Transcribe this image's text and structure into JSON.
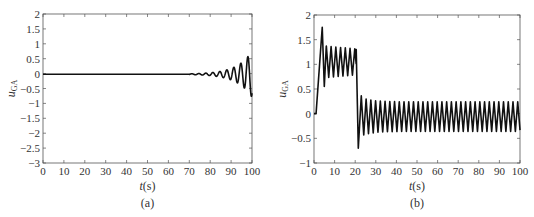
{
  "chart_data": [
    {
      "id": "a",
      "type": "line",
      "panel_label": "(a)",
      "xlabel": "t(s)",
      "ylabel": "u_GA",
      "xlim": [
        0,
        100
      ],
      "ylim": [
        -3,
        2
      ],
      "xticks": [
        0,
        10,
        20,
        30,
        40,
        50,
        60,
        70,
        80,
        90,
        100
      ],
      "yticks": [
        -3,
        -2.5,
        -2,
        -1.5,
        -1,
        -0.5,
        0,
        0.5,
        1,
        1.5,
        2
      ],
      "ytick_labels": [
        "−3",
        "−2.5",
        "−2",
        "−1.5",
        "−1",
        "−0.5",
        "0",
        "0.5",
        "1",
        "1.5",
        "2"
      ],
      "grid": false,
      "description": "Near-zero signal until ~70 s, then growing oscillation (period ~3.3 s) diverging to peak ≈1.75 at t≈98 and dropping to ≈−2.75 at t=100",
      "key_points": [
        {
          "t": 0,
          "u": -0.02
        },
        {
          "t": 70,
          "u": -0.02
        },
        {
          "t": 84,
          "u": 0.08
        },
        {
          "t": 86,
          "u": -0.1
        },
        {
          "t": 88,
          "u": 0.15
        },
        {
          "t": 89.5,
          "u": -0.3
        },
        {
          "t": 91,
          "u": 0.35
        },
        {
          "t": 92.5,
          "u": -0.55
        },
        {
          "t": 94.5,
          "u": 0.8
        },
        {
          "t": 96,
          "u": -1.25
        },
        {
          "t": 98,
          "u": 1.75
        },
        {
          "t": 100,
          "u": -2.75
        }
      ],
      "plot_box": {
        "x0": 43,
        "x1": 252,
        "y0": 14,
        "y1": 163
      }
    },
    {
      "id": "b",
      "type": "line",
      "panel_label": "(b)",
      "xlabel": "t(s)",
      "ylabel": "u_GA",
      "xlim": [
        0,
        100
      ],
      "ylim": [
        -1,
        2
      ],
      "xticks": [
        0,
        10,
        20,
        30,
        40,
        50,
        60,
        70,
        80,
        90,
        100
      ],
      "yticks": [
        -1,
        -0.5,
        0,
        0.5,
        1,
        1.5,
        2
      ],
      "ytick_labels": [
        "−1",
        "−0.5",
        "0",
        "0.5",
        "1",
        "1.5",
        "2"
      ],
      "grid": false,
      "description": "Starts at 0, overshoots to ≈1.75 at t≈4, oscillates between ≈0.7 and ≈1.35 until t≈21, drops to ≈−0.7, then sustained oscillation between ≈−0.4 and ≈0.25 (period ~2.3 s) until t=100",
      "key_points": [
        {
          "t": 0,
          "u": 0
        },
        {
          "t": 1,
          "u": 0
        },
        {
          "t": 4,
          "u": 1.75
        },
        {
          "t": 5,
          "u": 0.55
        },
        {
          "t": 6,
          "u": 1.4
        },
        {
          "t": 20.5,
          "u": 1.3
        },
        {
          "t": 21.5,
          "u": -0.7
        },
        {
          "t": 23,
          "u": 0.4
        },
        {
          "t": 24,
          "u": -0.4
        },
        {
          "t": 100,
          "u": 0.15
        }
      ],
      "segments": [
        {
          "t_start": 6,
          "t_end": 20.5,
          "center": 1.03,
          "amplitude": 0.32,
          "period": 2.3
        },
        {
          "t_start": 23,
          "t_end": 100,
          "center": -0.08,
          "amplitude": 0.3,
          "period": 2.3
        }
      ],
      "plot_box": {
        "x0": 314,
        "x1": 520,
        "y0": 15,
        "y1": 163
      }
    }
  ],
  "labels": {
    "panel_a": "(a)",
    "panel_b": "(b)",
    "xlabel_a": "t(s)",
    "xlabel_b": "t(s)",
    "ylabel_main": "u",
    "ylabel_sub": "GA"
  }
}
